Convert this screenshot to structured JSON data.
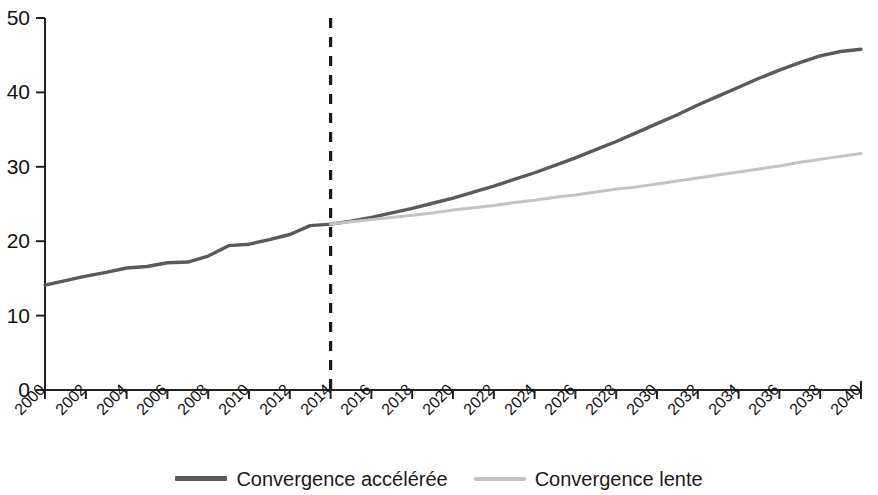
{
  "chart_data": {
    "type": "line",
    "title": "",
    "subtitle": "",
    "xlabel": "",
    "ylabel": "",
    "xlim": [
      2000,
      2040
    ],
    "ylim": [
      0,
      50
    ],
    "grid": false,
    "legend_position": "bottom-center",
    "y_ticks": [
      0,
      10,
      20,
      30,
      40,
      50
    ],
    "y_tick_labels": [
      "0",
      "10",
      "20",
      "30",
      "40",
      "50"
    ],
    "x_ticks": [
      2000,
      2002,
      2004,
      2006,
      2008,
      2010,
      2012,
      2014,
      2016,
      2018,
      2020,
      2022,
      2024,
      2026,
      2028,
      2030,
      2032,
      2034,
      2036,
      2038,
      2040
    ],
    "x_tick_labels": [
      "2000",
      "2002",
      "2004",
      "2006",
      "2008",
      "2010",
      "2012",
      "2014",
      "2016",
      "2018",
      "2020",
      "2022",
      "2024",
      "2026",
      "2028",
      "2030",
      "2032",
      "2034",
      "2036",
      "2038",
      "2040"
    ],
    "annotations": [
      {
        "name": "projection-divider",
        "type": "vertical-dashed-line",
        "x": 2014,
        "color": "#1a1a1a"
      }
    ],
    "x": [
      2000,
      2001,
      2002,
      2003,
      2004,
      2005,
      2006,
      2007,
      2008,
      2009,
      2010,
      2011,
      2012,
      2013,
      2014,
      2015,
      2016,
      2017,
      2018,
      2019,
      2020,
      2021,
      2022,
      2023,
      2024,
      2025,
      2026,
      2027,
      2028,
      2029,
      2030,
      2031,
      2032,
      2033,
      2034,
      2035,
      2036,
      2037,
      2038,
      2039,
      2040
    ],
    "series": [
      {
        "name": "Convergence accélérée",
        "color": "#5a5a5a",
        "values": [
          14.1,
          14.7,
          15.3,
          15.8,
          16.4,
          16.6,
          17.1,
          17.2,
          18.0,
          19.4,
          19.6,
          20.2,
          20.9,
          22.1,
          22.3,
          22.7,
          23.2,
          23.8,
          24.4,
          25.1,
          25.8,
          26.6,
          27.4,
          28.3,
          29.2,
          30.2,
          31.2,
          32.3,
          33.4,
          34.6,
          35.8,
          37.0,
          38.3,
          39.5,
          40.7,
          41.9,
          43.0,
          44.0,
          44.9,
          45.5,
          45.8
        ]
      },
      {
        "name": "Convergence lente",
        "color": "#c3c3c3",
        "values": [
          null,
          null,
          null,
          null,
          null,
          null,
          null,
          null,
          null,
          null,
          null,
          null,
          null,
          null,
          22.3,
          22.6,
          22.9,
          23.2,
          23.5,
          23.8,
          24.2,
          24.5,
          24.8,
          25.2,
          25.5,
          25.9,
          26.2,
          26.6,
          27.0,
          27.3,
          27.7,
          28.1,
          28.5,
          28.9,
          29.3,
          29.7,
          30.1,
          30.6,
          31.0,
          31.4,
          31.8
        ]
      }
    ]
  },
  "legend": {
    "items": [
      {
        "label": "Convergence accélérée",
        "color": "#5a5a5a"
      },
      {
        "label": "Convergence lente",
        "color": "#c3c3c3"
      }
    ]
  },
  "colors": {
    "axis": "#222222",
    "accelerated": "#5a5a5a",
    "slow": "#c3c3c3",
    "divider": "#1a1a1a",
    "background": "#ffffff"
  }
}
